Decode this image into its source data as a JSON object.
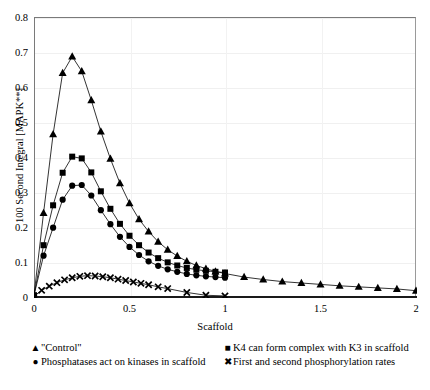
{
  "chart_data": {
    "type": "line",
    "title": "",
    "xlabel": "Scaffold",
    "ylabel": "100 Second Integral [MAPK**]",
    "xlim": [
      0,
      2
    ],
    "ylim": [
      0,
      0.8
    ],
    "xticks": [
      "0",
      "0.5",
      "1",
      "1.5",
      "2"
    ],
    "xtick_values": [
      0,
      0.5,
      1,
      1.5,
      2
    ],
    "yticks": [
      "0",
      "0.1",
      "0.2",
      "0.3",
      "0.4",
      "0.5",
      "0.6",
      "0.7",
      "0.8"
    ],
    "ytick_values": [
      0,
      0.1,
      0.2,
      0.3,
      0.4,
      0.5,
      0.6,
      0.7,
      0.8
    ],
    "grid": true,
    "legend_position": "bottom",
    "series": [
      {
        "name": "\"Control\"",
        "marker": "triangle",
        "color": "#000000",
        "x": [
          0,
          0.05,
          0.1,
          0.15,
          0.2,
          0.25,
          0.3,
          0.35,
          0.4,
          0.45,
          0.5,
          0.55,
          0.6,
          0.65,
          0.7,
          0.75,
          0.8,
          0.85,
          0.9,
          0.95,
          1.0,
          1.1,
          1.2,
          1.3,
          1.4,
          1.5,
          1.6,
          1.7,
          1.8,
          1.9,
          2.0
        ],
        "y": [
          0.005,
          0.24,
          0.465,
          0.64,
          0.687,
          0.645,
          0.562,
          0.473,
          0.395,
          0.325,
          0.268,
          0.222,
          0.187,
          0.158,
          0.135,
          0.117,
          0.102,
          0.09,
          0.081,
          0.073,
          0.067,
          0.057,
          0.05,
          0.044,
          0.04,
          0.036,
          0.032,
          0.029,
          0.026,
          0.023,
          0.018
        ]
      },
      {
        "name": "K4 can form complex with K3 in scaffold",
        "marker": "square",
        "color": "#000000",
        "x": [
          0,
          0.05,
          0.1,
          0.15,
          0.2,
          0.25,
          0.3,
          0.35,
          0.4,
          0.45,
          0.5,
          0.55,
          0.6,
          0.65,
          0.7,
          0.75,
          0.8,
          0.85,
          0.9,
          0.95,
          1.0
        ],
        "y": [
          0.005,
          0.148,
          0.262,
          0.355,
          0.401,
          0.396,
          0.356,
          0.302,
          0.252,
          0.209,
          0.175,
          0.148,
          0.127,
          0.111,
          0.099,
          0.09,
          0.083,
          0.078,
          0.075,
          0.072,
          0.07
        ]
      },
      {
        "name": "Phosphatases act on kinases in scaffold",
        "marker": "circle",
        "color": "#000000",
        "x": [
          0,
          0.05,
          0.1,
          0.15,
          0.2,
          0.25,
          0.3,
          0.35,
          0.4,
          0.45,
          0.5,
          0.55,
          0.6,
          0.65,
          0.7,
          0.75,
          0.8,
          0.85,
          0.9,
          0.95,
          1.0
        ],
        "y": [
          0.005,
          0.118,
          0.198,
          0.278,
          0.318,
          0.32,
          0.29,
          0.248,
          0.208,
          0.172,
          0.143,
          0.12,
          0.102,
          0.089,
          0.079,
          0.072,
          0.066,
          0.062,
          0.059,
          0.057,
          0.055
        ]
      },
      {
        "name": "First and second phosphorylation rates",
        "marker": "cross",
        "color": "#000000",
        "x": [
          0,
          0.04,
          0.08,
          0.12,
          0.16,
          0.2,
          0.24,
          0.28,
          0.32,
          0.36,
          0.4,
          0.44,
          0.48,
          0.52,
          0.56,
          0.6,
          0.65,
          0.7,
          0.8,
          0.9,
          1.0
        ],
        "y": [
          0.002,
          0.019,
          0.031,
          0.041,
          0.049,
          0.055,
          0.059,
          0.061,
          0.06,
          0.058,
          0.055,
          0.051,
          0.047,
          0.043,
          0.039,
          0.035,
          0.029,
          0.024,
          0.013,
          0.005,
          0.003
        ]
      }
    ]
  },
  "legend": {
    "items": [
      {
        "marker": "▲",
        "label": "\"Control\""
      },
      {
        "marker": "●",
        "label": "Phosphatases act on kinases in scaffold"
      },
      {
        "marker": "■",
        "label": "K4 can form complex with K3 in scaffold"
      },
      {
        "marker": "✖",
        "label": "First and second phosphorylation rates"
      }
    ]
  },
  "axes": {
    "x_title": "Scaffold",
    "y_title": "100 Second Integral [MAPK**]"
  }
}
